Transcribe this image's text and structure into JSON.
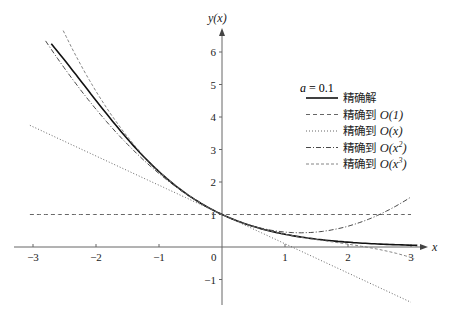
{
  "chart_data": {
    "type": "line",
    "title": "",
    "xlabel": "x",
    "ylabel": "y(x)",
    "xlim": [
      -3.3,
      3.2
    ],
    "ylim": [
      -1.8,
      6.6
    ],
    "x_ticks": [
      -3,
      -2,
      -1,
      0,
      1,
      2,
      3
    ],
    "x_tick_labels": [
      "−3",
      "−2",
      "−1",
      "0",
      "1",
      "2",
      "3"
    ],
    "y_ticks": [
      -1,
      1,
      2,
      3,
      4,
      5,
      6
    ],
    "y_tick_labels": [
      "−1",
      "1",
      "2",
      "3",
      "4",
      "5",
      "6"
    ],
    "grid": false,
    "legend_position": "upper right",
    "legend_title": "a = 0.1",
    "parameter_a": 0.1,
    "series": [
      {
        "name": "精确解",
        "style": "solid",
        "color": "#111111",
        "formula": "e^{-x}/(1+a(e^{-x}-1))",
        "x_range": [
          -2.71,
          3.1
        ],
        "points": [
          [
            -2.71,
            6.25
          ],
          [
            -2,
            4.43
          ],
          [
            -1.78,
            3.97
          ],
          [
            -1,
            2.32
          ],
          [
            0,
            1
          ],
          [
            1,
            0.34
          ],
          [
            2,
            0.14
          ],
          [
            3,
            0.055
          ]
        ]
      },
      {
        "name": "精确到 O(1)",
        "style": "dashed",
        "color": "#555555",
        "formula": "1",
        "x_range": [
          -3.05,
          3.0
        ],
        "points": [
          [
            -3.05,
            1
          ],
          [
            3.0,
            1
          ]
        ]
      },
      {
        "name": "精确到 O(x)",
        "style": "dotted",
        "color": "#555555",
        "formula": "1 - 0.9x",
        "x_range": [
          -3.05,
          3.0
        ],
        "points": [
          [
            -3.05,
            3.75
          ],
          [
            0,
            1
          ],
          [
            3.0,
            -1.7
          ]
        ]
      },
      {
        "name": "精确到 O(x²)",
        "style": "dashdot",
        "color": "#333333",
        "formula": "1 - 0.9x + 0.36x²",
        "x_range": [
          -2.8,
          3.0
        ],
        "points": [
          [
            -2.8,
            6.34
          ],
          [
            -2,
            4.24
          ],
          [
            -1,
            2.26
          ],
          [
            0,
            1
          ],
          [
            1,
            0.46
          ],
          [
            2,
            0.64
          ],
          [
            3,
            1.54
          ]
        ]
      },
      {
        "name": "精确到 O(x³)",
        "style": "dashed-fine",
        "color": "#777777",
        "formula": "1 - 0.9x + 0.36x² - 0.069x³",
        "x_range": [
          -2.52,
          3.05
        ],
        "points": [
          [
            -2.52,
            6.66
          ],
          [
            -2,
            4.79
          ],
          [
            -1,
            2.33
          ],
          [
            0,
            1
          ],
          [
            1,
            0.39
          ],
          [
            2,
            0.09
          ],
          [
            3,
            -0.32
          ]
        ]
      }
    ]
  },
  "legend": {
    "title_var": "a",
    "title_eq": " = 0.1",
    "items": [
      {
        "prefix": "精确解",
        "math": "",
        "sup": "",
        "suffix": ""
      },
      {
        "prefix": "精确到 ",
        "math": "O(1)",
        "sup": "",
        "suffix": ""
      },
      {
        "prefix": "精确到 ",
        "math": "O(x)",
        "sup": "",
        "suffix": ""
      },
      {
        "prefix": "精确到 ",
        "math": "O(x",
        "sup": "2",
        "suffix": ")"
      },
      {
        "prefix": "精确到 ",
        "math": "O(x",
        "sup": "3",
        "suffix": ")"
      }
    ]
  },
  "axes": {
    "x_label": "x",
    "y_label": "y(x)",
    "origin_label": "0"
  }
}
